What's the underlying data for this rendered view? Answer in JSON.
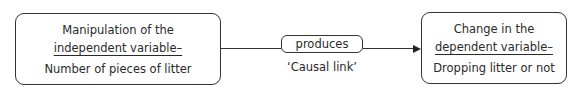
{
  "diagram": {
    "left_box": {
      "line1": "Manipulation of the",
      "line2": "independent variable–",
      "line3": "Number of pieces of litter"
    },
    "middle_box": {
      "label": "produces",
      "caption": "‘Causal link’"
    },
    "right_box": {
      "line1": "Change in the",
      "line2": "dependent variable–",
      "line3": "Dropping litter or not"
    },
    "colors": {
      "stroke": "#333333",
      "text": "#2a2a2a",
      "background": "#ffffff"
    }
  }
}
